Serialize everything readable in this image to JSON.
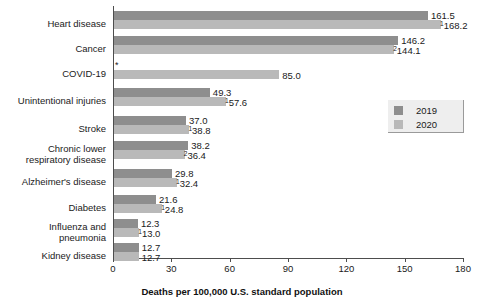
{
  "chart_data": {
    "type": "bar",
    "orientation": "horizontal",
    "title": "",
    "xlabel": "Deaths per 100,000 U.S. standard population",
    "ylabel": "",
    "xlim": [
      0,
      180
    ],
    "xticks": [
      0,
      30,
      60,
      90,
      120,
      150,
      180
    ],
    "grid": false,
    "legend_position": "right",
    "categories": [
      "Heart disease",
      "Cancer",
      "COVID-19",
      "Unintentional injuries",
      "Stroke",
      "Chronic lower\nrespiratory disease",
      "Alzheimer's disease",
      "Diabetes",
      "Influenza and\npneumonia",
      "Kidney disease"
    ],
    "series": [
      {
        "name": "2019",
        "color": "#8e8e8e",
        "values": [
          161.5,
          146.2,
          null,
          49.3,
          37.0,
          38.2,
          29.8,
          21.6,
          12.3,
          12.7
        ],
        "labels": [
          "161.5",
          "146.2",
          "",
          "49.3",
          "37.0",
          "38.2",
          "29.8",
          "21.6",
          "12.3",
          "12.7"
        ],
        "label_marks": [
          "",
          "",
          "",
          "",
          "",
          "",
          "",
          "",
          "",
          ""
        ]
      },
      {
        "name": "2020",
        "color": "#b9b9b9",
        "values": [
          168.2,
          144.1,
          85.0,
          57.6,
          38.8,
          36.4,
          32.4,
          24.8,
          13.0,
          12.7
        ],
        "labels": [
          "168.2",
          "144.1",
          "85.0",
          "57.6",
          "38.8",
          "36.4",
          "32.4",
          "24.8",
          "13.0",
          "12.7"
        ],
        "label_marks": [
          "1",
          "2",
          "",
          "1",
          "1",
          "2",
          "1",
          "1",
          "1",
          ""
        ]
      }
    ],
    "annotations": {
      "covid_2019_missing_mark": "*"
    }
  },
  "legend": {
    "items": [
      {
        "label": "2019",
        "color": "#8e8e8e"
      },
      {
        "label": "2020",
        "color": "#b9b9b9"
      }
    ]
  },
  "axis": {
    "tick_labels": [
      "0",
      "30",
      "60",
      "90",
      "120",
      "150",
      "180"
    ],
    "x_axis_title": "Deaths per 100,000 U.S. standard population"
  }
}
